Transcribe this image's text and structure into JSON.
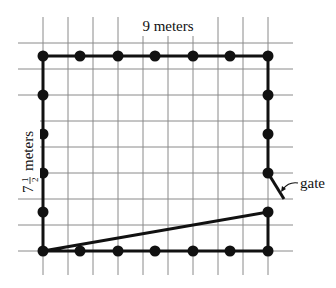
{
  "diagram": {
    "top_label": "9 meters",
    "side_label_whole": "7",
    "side_label_num": "1",
    "side_label_den": "2",
    "side_label_unit": "meters",
    "gate_label": "gate",
    "colors": {
      "grid": "#8a8a8a",
      "fence": "#111111",
      "post": "#111111",
      "background": "#ffffff"
    },
    "grid": {
      "vertical_x": [
        43,
        68,
        93,
        118,
        143,
        168,
        193,
        218,
        243,
        268
      ],
      "horizontal_y": [
        43,
        69,
        95,
        121,
        147,
        173,
        199,
        225,
        251
      ],
      "x_range": [
        18,
        293
      ],
      "y_range": [
        17,
        275
      ]
    },
    "fence": {
      "left": 43,
      "right": 268,
      "top": 56,
      "bottom": 251,
      "width_m": 9,
      "height_m": 7.5,
      "post_spacing_m": 1.5
    },
    "posts": {
      "top": [
        [
          43,
          56
        ],
        [
          80,
          56
        ],
        [
          118,
          56
        ],
        [
          155,
          56
        ],
        [
          193,
          56
        ],
        [
          230,
          56
        ],
        [
          268,
          56
        ]
      ],
      "bottom": [
        [
          43,
          251
        ],
        [
          80,
          251
        ],
        [
          118,
          251
        ],
        [
          155,
          251
        ],
        [
          193,
          251
        ],
        [
          230,
          251
        ],
        [
          268,
          251
        ]
      ],
      "left": [
        [
          43,
          95
        ],
        [
          43,
          134
        ],
        [
          43,
          173
        ],
        [
          43,
          212
        ]
      ],
      "right": [
        [
          268,
          95
        ],
        [
          268,
          134
        ],
        [
          268,
          173
        ],
        [
          268,
          212
        ]
      ]
    },
    "gate": {
      "hinge": [
        268,
        173
      ],
      "end": [
        284,
        199
      ]
    }
  }
}
